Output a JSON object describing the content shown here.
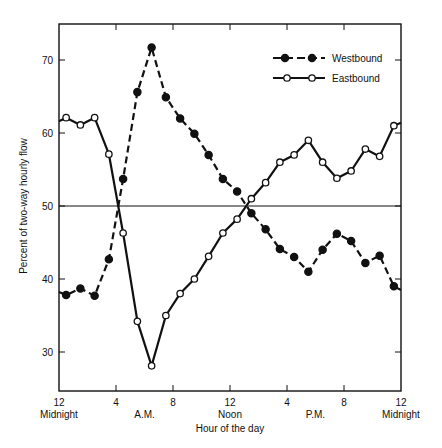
{
  "chart_data": {
    "type": "line",
    "title": "",
    "xlabel": "Hour of the day",
    "ylabel": "Percent of two-way hourly flow",
    "ylim": [
      25,
      75
    ],
    "xlim": [
      0,
      24
    ],
    "grid": false,
    "reference_line": {
      "y": 50
    },
    "legend_position": "upper right (inside)",
    "x_ticks": [
      {
        "hour": 0,
        "label": "12",
        "sublabel": "Midnight"
      },
      {
        "hour": 4,
        "label": "4",
        "sublabel": ""
      },
      {
        "hour": 8,
        "label": "8",
        "sublabel": ""
      },
      {
        "hour": 12,
        "label": "12",
        "sublabel": "Noon"
      },
      {
        "hour": 16,
        "label": "4",
        "sublabel": ""
      },
      {
        "hour": 20,
        "label": "8",
        "sublabel": ""
      },
      {
        "hour": 24,
        "label": "12",
        "sublabel": "Midnight"
      }
    ],
    "x_period_labels": [
      {
        "hour": 6,
        "label": "A.M."
      },
      {
        "hour": 18,
        "label": "P.M."
      }
    ],
    "y_ticks": [
      30,
      40,
      50,
      60,
      70
    ],
    "x": [
      0.5,
      1.5,
      2.5,
      3.5,
      4.5,
      5.5,
      6.5,
      7.5,
      8.5,
      9.5,
      10.5,
      11.5,
      12.5,
      13.5,
      14.5,
      15.5,
      16.5,
      17.5,
      18.5,
      19.5,
      20.5,
      21.5,
      22.5,
      23.5
    ],
    "series": [
      {
        "name": "Westbound",
        "marker": "filled-circle",
        "line": "dashed",
        "start_value": 38.2,
        "end_value": 38.5,
        "values": [
          37.8,
          38.7,
          37.7,
          42.7,
          53.7,
          65.6,
          71.7,
          64.9,
          62.0,
          59.9,
          57.0,
          53.7,
          52.0,
          49.0,
          46.8,
          44.1,
          43.0,
          41.0,
          44.0,
          46.2,
          45.2,
          42.2,
          43.2,
          39.0
        ]
      },
      {
        "name": "Eastbound",
        "marker": "open-circle",
        "line": "solid",
        "start_value": 61.6,
        "end_value": 61.4,
        "values": [
          62.1,
          61.1,
          62.1,
          57.1,
          46.3,
          34.2,
          28.1,
          35.0,
          38.0,
          40.0,
          43.1,
          46.3,
          48.2,
          51.0,
          53.2,
          56.0,
          57.0,
          59.0,
          56.0,
          53.8,
          54.8,
          57.8,
          56.8,
          61.0
        ]
      }
    ]
  }
}
